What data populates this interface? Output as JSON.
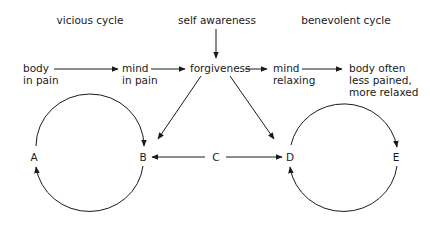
{
  "headings": {
    "vicious": "vicious cycle",
    "self_awareness": "self awareness",
    "benevolent": "benevolent cycle"
  },
  "flow": {
    "body_in_pain": [
      "body",
      "in pain"
    ],
    "mind_in_pain": [
      "mind",
      "in pain"
    ],
    "forgiveness": "forgiveness",
    "mind_relaxing": [
      "mind",
      "relaxing"
    ],
    "body_relaxed": [
      "body often",
      "less pained,",
      "more relaxed"
    ]
  },
  "nodes": {
    "A": "A",
    "B": "B",
    "C": "C",
    "D": "D",
    "E": "E"
  },
  "colors": {
    "ink": "#1a1a1a",
    "background": "#ffffff"
  }
}
